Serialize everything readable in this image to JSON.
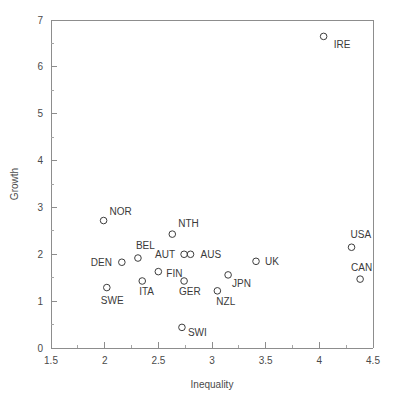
{
  "chart_data": {
    "type": "scatter",
    "title": "",
    "subtitle": "",
    "xlabel": "Inequality",
    "ylabel": "Growth",
    "xlim": [
      1.5,
      4.5
    ],
    "ylim": [
      0,
      7
    ],
    "xticks": [
      "1.5",
      "2",
      "2.5",
      "3",
      "3.5",
      "4",
      "4.5"
    ],
    "xtick_values": [
      1.5,
      2,
      2.5,
      3,
      3.5,
      4,
      4.5
    ],
    "xminor_values": [
      1.75,
      2.25,
      2.75,
      3.25,
      3.75,
      4.25
    ],
    "yticks": [
      "0",
      "1",
      "2",
      "3",
      "4",
      "5",
      "6",
      "7"
    ],
    "ytick_values": [
      0,
      1,
      2,
      3,
      4,
      5,
      6,
      7
    ],
    "yminor_values": [
      0.5,
      1.5,
      2.5,
      3.5,
      4.5,
      5.5,
      6.5
    ],
    "grid": false,
    "legend": "none",
    "marker": "open-circle",
    "marker_color": "#3d3d3d",
    "axis_color": "#8d8d8d",
    "background": "#ffffff",
    "points": [
      {
        "label": "IRE",
        "x": 4.04,
        "y": 6.65,
        "label_dx": 10,
        "label_dy": 12
      },
      {
        "label": "NOR",
        "x": 1.99,
        "y": 2.72,
        "label_dx": 6,
        "label_dy": -6
      },
      {
        "label": "NTH",
        "x": 2.63,
        "y": 2.43,
        "label_dx": 6,
        "label_dy": -7
      },
      {
        "label": "USA",
        "x": 4.3,
        "y": 2.15,
        "label_dx": -1,
        "label_dy": -9
      },
      {
        "label": "BEL",
        "x": 2.31,
        "y": 1.92,
        "label_dx": -2,
        "label_dy": -9
      },
      {
        "label": "AUT",
        "x": 2.74,
        "y": 2.0,
        "label_dx": -29,
        "label_dy": 4
      },
      {
        "label": "AUS",
        "x": 2.8,
        "y": 2.0,
        "label_dx": 10,
        "label_dy": 4
      },
      {
        "label": "DEN",
        "x": 2.16,
        "y": 1.83,
        "label_dx": -31,
        "label_dy": 4
      },
      {
        "label": "UK",
        "x": 3.41,
        "y": 1.85,
        "label_dx": 9,
        "label_dy": 4
      },
      {
        "label": "FIN",
        "x": 2.5,
        "y": 1.63,
        "label_dx": 8,
        "label_dy": 5
      },
      {
        "label": "JPN",
        "x": 3.15,
        "y": 1.56,
        "label_dx": 4,
        "label_dy": 12
      },
      {
        "label": "CAN",
        "x": 4.38,
        "y": 1.47,
        "label_dx": -9,
        "label_dy": -8
      },
      {
        "label": "ITA",
        "x": 2.35,
        "y": 1.43,
        "label_dx": -3,
        "label_dy": 14
      },
      {
        "label": "GER",
        "x": 2.74,
        "y": 1.43,
        "label_dx": -5,
        "label_dy": 14
      },
      {
        "label": "NZL",
        "x": 3.05,
        "y": 1.22,
        "label_dx": -1,
        "label_dy": 14
      },
      {
        "label": "SWE",
        "x": 2.02,
        "y": 1.29,
        "label_dx": -6,
        "label_dy": 16
      },
      {
        "label": "SWI",
        "x": 2.72,
        "y": 0.44,
        "label_dx": 6,
        "label_dy": 9
      }
    ]
  }
}
